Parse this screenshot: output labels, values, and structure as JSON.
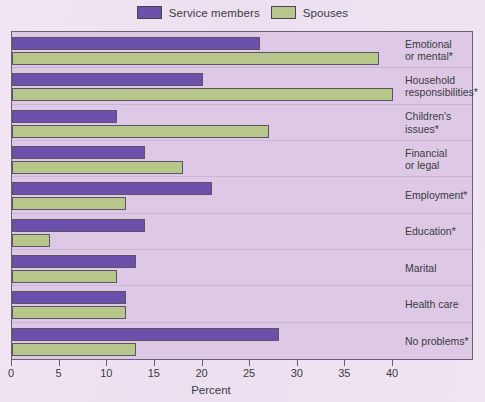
{
  "legend": {
    "entries": [
      {
        "label": "Service members",
        "color": "#6b51ab",
        "name": "service-members"
      },
      {
        "label": "Spouses",
        "color": "#b7c78c",
        "name": "spouses"
      }
    ]
  },
  "axis": {
    "title": "Percent",
    "ticks": [
      0,
      5,
      10,
      15,
      20,
      25,
      30,
      35,
      40
    ]
  },
  "chart_data": {
    "type": "bar",
    "orientation": "horizontal",
    "title": "",
    "xlabel": "Percent",
    "ylabel": "",
    "xlim": [
      0,
      40
    ],
    "grid": false,
    "legend_position": "top-center",
    "categories": [
      "Emotional\nor mental*",
      "Household\nresponsibilities*",
      "Children's\nissues*",
      "Financial\nor legal",
      "Employment*",
      "Education*",
      "Marital",
      "Health care",
      "No problems*"
    ],
    "series": [
      {
        "name": "Service members",
        "color": "#6b51ab",
        "values": [
          26,
          20,
          11,
          14,
          21,
          14,
          13,
          12,
          28
        ]
      },
      {
        "name": "Spouses",
        "color": "#b7c78c",
        "values": [
          38.5,
          40,
          27,
          18,
          12,
          4,
          11,
          12,
          13
        ]
      }
    ]
  }
}
